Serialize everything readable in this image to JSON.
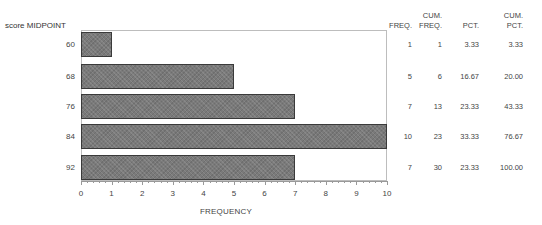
{
  "chart_data": {
    "type": "bar",
    "orientation": "horizontal",
    "title": "",
    "ylabel": "score MIDPOINT",
    "xlabel": "FREQUENCY",
    "categories": [
      "60",
      "68",
      "76",
      "84",
      "92"
    ],
    "values": [
      1,
      5,
      7,
      10,
      7
    ],
    "xlim": [
      0,
      10
    ],
    "xticks": [
      "0",
      "1",
      "2",
      "3",
      "4",
      "5",
      "6",
      "7",
      "8",
      "9",
      "10"
    ],
    "grid": false,
    "legend": null,
    "table": {
      "columns": [
        "FREQ.",
        "CUM. FREQ.",
        "PCT.",
        "CUM. PCT."
      ],
      "rows": [
        {
          "freq": "1",
          "cum_freq": "1",
          "pct": "3.33",
          "cum_pct": "3.33"
        },
        {
          "freq": "5",
          "cum_freq": "6",
          "pct": "16.67",
          "cum_pct": "20.00"
        },
        {
          "freq": "7",
          "cum_freq": "13",
          "pct": "23.33",
          "cum_pct": "43.33"
        },
        {
          "freq": "10",
          "cum_freq": "23",
          "pct": "33.33",
          "cum_pct": "76.67"
        },
        {
          "freq": "7",
          "cum_freq": "30",
          "pct": "23.33",
          "cum_pct": "100.00"
        }
      ]
    }
  },
  "headers": {
    "freq": "FREQ.",
    "cum_freq_top": "CUM.",
    "cum_freq_bottom": "FREQ.",
    "pct": "PCT.",
    "cum_pct_top": "CUM.",
    "cum_pct_bottom": "PCT."
  },
  "colors": {
    "bar_fill": "#7a7a7a",
    "bar_border": "#3a3a3a",
    "frame": "#bdbdbd"
  }
}
